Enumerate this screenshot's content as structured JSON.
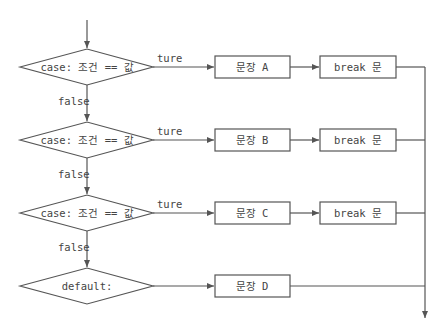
{
  "colors": {
    "stroke": "#555555",
    "text": "#444444",
    "background": "#ffffff"
  },
  "decisions": [
    {
      "label": "case: 조건 == 값",
      "true_label": "ture",
      "false_label": "false"
    },
    {
      "label": "case: 조건 == 값",
      "true_label": "ture",
      "false_label": "false"
    },
    {
      "label": "case: 조건 == 값",
      "true_label": "ture",
      "false_label": "false"
    },
    {
      "label": "default:"
    }
  ],
  "statements": [
    {
      "label": "문장 A",
      "break_label": "break 문"
    },
    {
      "label": "문장 B",
      "break_label": "break 문"
    },
    {
      "label": "문장 C",
      "break_label": "break 문"
    },
    {
      "label": "문장 D"
    }
  ]
}
